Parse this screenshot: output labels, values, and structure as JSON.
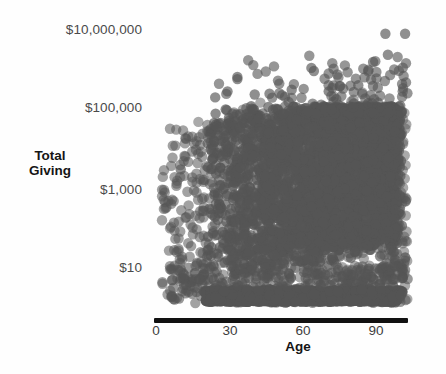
{
  "figure": {
    "background_color": "#fefefe",
    "point_color": "#555555",
    "axis_color": "#111111",
    "label_color": "#4a4a4a",
    "title_color": "#151515"
  },
  "axes": {
    "y_title_line1": "Total",
    "y_title_line2": "Giving",
    "x_title": "Age"
  },
  "caption": {
    "text": ""
  },
  "chart_data": {
    "type": "scatter",
    "title": "",
    "subtitle": "",
    "xlabel": "Age",
    "ylabel": "Total Giving",
    "grid": false,
    "legend": null,
    "yscale": "log",
    "xscale": "linear",
    "xlim": [
      0,
      105
    ],
    "ylim": [
      1,
      30000000
    ],
    "xticks": [
      0,
      30,
      60,
      90
    ],
    "xticklabels": [
      "0",
      "30",
      "60",
      "90"
    ],
    "yticks": [
      10,
      1000,
      100000,
      10000000
    ],
    "yticklabels": [
      "$10",
      "$1,000",
      "$100,000",
      "$10,000,000"
    ],
    "marker": {
      "shape": "circle",
      "radius_px": 5.2,
      "fill": "#555555",
      "opacity": 0.62,
      "edge": "none"
    },
    "n_points_approx": 4200,
    "series": [
      {
        "name": "Donors",
        "color": "#555555",
        "core": {
          "x_range": [
            18,
            98
          ],
          "y_range": [
            5,
            60000
          ],
          "density": "saturated"
        },
        "points_visible_outliers": [
          {
            "x": 93,
            "y": 9000000
          },
          {
            "x": 101,
            "y": 9000000
          },
          {
            "x": 94,
            "y": 2600000
          },
          {
            "x": 88,
            "y": 1700000
          },
          {
            "x": 63,
            "y": 1200000
          },
          {
            "x": 64,
            "y": 1000000
          },
          {
            "x": 33,
            "y": 700000
          },
          {
            "x": 33,
            "y": 620000
          },
          {
            "x": 55,
            "y": 330000
          },
          {
            "x": 82,
            "y": 430000
          },
          {
            "x": 70,
            "y": 300000
          },
          {
            "x": 29,
            "y": 300000
          },
          {
            "x": 46,
            "y": 260000
          },
          {
            "x": 24,
            "y": 210000
          },
          {
            "x": 40,
            "y": 250000
          },
          {
            "x": 99,
            "y": 130000
          },
          {
            "x": 86,
            "y": 150000
          },
          {
            "x": 10,
            "y": 3000
          },
          {
            "x": 100,
            "y": 5
          }
        ],
        "bands": [
          {
            "y_value": 2.2,
            "x_range": [
              19,
              100
            ],
            "note": "dense band of very small gifts"
          },
          {
            "y_value": 1.3,
            "x_range": [
              20,
              98
            ],
            "note": "second dense band at axis"
          }
        ]
      }
    ]
  }
}
